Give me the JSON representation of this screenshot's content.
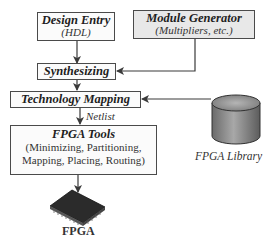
{
  "diagram": {
    "nodes": {
      "design_entry": {
        "title": "Design Entry",
        "subtitle": "(HDL)"
      },
      "module_generator": {
        "title": "Module Generator",
        "subtitle": "(Multipliers, etc.)"
      },
      "synthesizing": {
        "title": "Synthesizing"
      },
      "technology_mapping": {
        "title": "Technology Mapping"
      },
      "fpga_tools": {
        "title": "FPGA Tools",
        "line1": "(Minimizing, Partitioning,",
        "line2": "Mapping, Placing, Routing)"
      },
      "fpga_library": {
        "label": "FPGA Library",
        "icon": "database-cylinder-icon"
      },
      "fpga": {
        "label": "FPGA",
        "icon": "chip-icon"
      }
    },
    "edge_labels": {
      "netlist": "Netlist"
    },
    "edges": [
      {
        "from": "Design Entry",
        "to": "Synthesizing"
      },
      {
        "from": "Module Generator",
        "to": "Synthesizing"
      },
      {
        "from": "Synthesizing",
        "to": "Technology Mapping"
      },
      {
        "from": "FPGA Library",
        "to": "Technology Mapping"
      },
      {
        "from": "Technology Mapping",
        "to": "FPGA Tools",
        "label": "Netlist"
      },
      {
        "from": "FPGA Tools",
        "to": "FPGA"
      }
    ],
    "colors": {
      "line": "#3a3a3a",
      "box_border": "#4a4a4a",
      "gray_box": "#e8e8e8",
      "cylinder": "#8a8a8a",
      "chip": "#2a2a2a"
    }
  }
}
